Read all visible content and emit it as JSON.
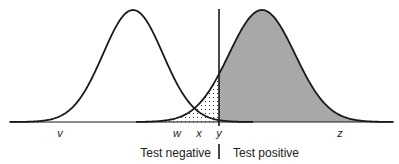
{
  "diagram": {
    "curves": [
      {
        "name": "healthy-distribution",
        "peak_x": 133,
        "sigma": 30
      },
      {
        "name": "diseased-distribution",
        "peak_x": 262,
        "sigma": 33
      }
    ],
    "cutoff_x": 219,
    "axis_labels": {
      "v": "v",
      "w": "w",
      "x": "x",
      "y": "y",
      "z": "z"
    },
    "regions": {
      "negative": "Test negative",
      "positive": "Test positive"
    },
    "colors": {
      "line": "#1a1a1a",
      "positive_fill": "#a8a8a8",
      "dot": "#333333",
      "hatch": "#222222",
      "background": "#ffffff"
    },
    "legend_semantics": {
      "dotted_area": "false negatives",
      "hatched_area": "false positives",
      "gray_area": "true positives"
    }
  }
}
